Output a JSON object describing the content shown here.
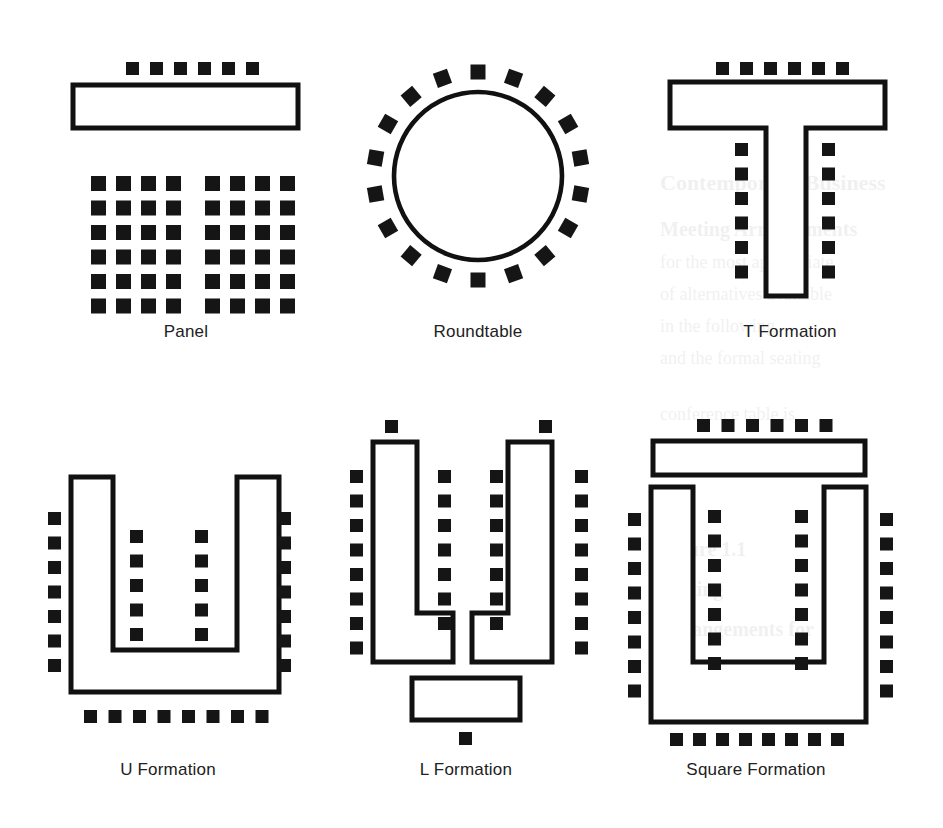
{
  "figure": {
    "background_color": "#ffffff",
    "ink_color": "#151515",
    "stroke_color": "#111111",
    "canvas": {
      "width": 943,
      "height": 828
    }
  },
  "captions": {
    "panel": "Panel",
    "roundtable": "Roundtable",
    "t_formation": "T Formation",
    "u_formation": "U Formation",
    "l_formation": "L Formation",
    "square_formation": "Square Formation"
  },
  "diagrams": [
    {
      "id": "panel",
      "label": "Panel",
      "caption_x": 186,
      "caption_y": 337,
      "chair_counts": {
        "head_table": 6,
        "audience_left_block": 24,
        "audience_right_block": 24
      },
      "tables": [
        {
          "name": "panel-head-table",
          "x": 73,
          "y": 85,
          "w": 225,
          "h": 43
        }
      ],
      "chair_rows": [
        {
          "name": "panel-head-chairs",
          "x0": 126,
          "y": 62,
          "count": 6,
          "step": 24,
          "size": 13
        }
      ],
      "grids": [
        {
          "name": "panel-audience-left",
          "x0": 91,
          "y0": 176,
          "cols": 4,
          "rows": 6,
          "dx": 25,
          "dy": 24.5,
          "size": 15
        },
        {
          "name": "panel-audience-right",
          "x0": 205,
          "y0": 176,
          "cols": 4,
          "rows": 6,
          "dx": 25,
          "dy": 24.5,
          "size": 15
        }
      ]
    },
    {
      "id": "roundtable",
      "label": "Roundtable",
      "caption_x": 478,
      "caption_y": 337,
      "chair_counts": {
        "around_table": 18
      },
      "circle": {
        "cx": 478,
        "cy": 176,
        "r": 84
      },
      "chair_ring": {
        "cx": 478,
        "cy": 176,
        "radius": 104,
        "count": 18,
        "size": 15,
        "start_angle_deg": -90
      }
    },
    {
      "id": "t-formation",
      "label": "T Formation",
      "caption_x": 790,
      "caption_y": 337,
      "chair_counts": {
        "top": 6,
        "stem_left": 6,
        "stem_right": 6
      },
      "polygon": "T-shape: crossbar 670,82 to 885,128 ; stem 766,128 to 806,296",
      "chair_rows": [
        {
          "name": "t-top-chairs",
          "x0": 716,
          "y": 62,
          "count": 6,
          "step": 24,
          "size": 13
        }
      ],
      "chair_columns": [
        {
          "name": "t-stem-left-chairs",
          "x": 735,
          "y0": 143,
          "count": 6,
          "step": 24.5,
          "size": 13
        },
        {
          "name": "t-stem-right-chairs",
          "x": 822,
          "y0": 143,
          "count": 6,
          "step": 24.5,
          "size": 13
        }
      ]
    },
    {
      "id": "u-formation",
      "label": "U Formation",
      "caption_x": 168,
      "caption_y": 775,
      "chair_counts": {
        "outer_left": 7,
        "outer_right": 7,
        "inner_left": 5,
        "inner_right": 5,
        "bottom": 8
      },
      "polygon": "U-shape: outer 71,477 to 265,477 / 265,650 / 178,650 / 178,477 (mirrored right)",
      "chair_columns": [
        {
          "name": "u-outer-left-chairs",
          "x": 48,
          "y0": 512,
          "count": 7,
          "step": 24.5,
          "size": 13
        },
        {
          "name": "u-outer-right-chairs",
          "x": 278,
          "y0": 512,
          "count": 7,
          "step": 24.5,
          "size": 13
        },
        {
          "name": "u-inner-left-chairs",
          "x": 130,
          "y0": 530,
          "count": 5,
          "step": 24.5,
          "size": 13
        },
        {
          "name": "u-inner-right-chairs",
          "x": 195,
          "y0": 530,
          "count": 5,
          "step": 24.5,
          "size": 13
        }
      ],
      "chair_rows": [
        {
          "name": "u-bottom-chairs",
          "x0": 84,
          "y": 710,
          "count": 8,
          "step": 24.5,
          "size": 13
        }
      ]
    },
    {
      "id": "l-formation",
      "label": "L Formation",
      "caption_x": 466,
      "caption_y": 775,
      "chair_counts": {
        "left_top": 1,
        "left_outer": 8,
        "left_inner": 7,
        "right_top": 1,
        "right_outer": 8,
        "right_inner": 7,
        "bottom_table": 1
      },
      "tables": [
        {
          "name": "l-bottom-table",
          "x": 412,
          "y": 678,
          "w": 108,
          "h": 42
        }
      ],
      "chair_rows": [],
      "single_chairs": [
        {
          "name": "l-left-top-chair",
          "x": 385,
          "y": 420,
          "size": 13
        },
        {
          "name": "l-right-top-chair",
          "x": 539,
          "y": 420,
          "size": 13
        },
        {
          "name": "l-bottom-chair",
          "x": 459,
          "y": 732,
          "size": 13
        }
      ],
      "chair_columns": [
        {
          "name": "l-left-outer-chairs",
          "x": 350,
          "y0": 470,
          "count": 8,
          "step": 24.5,
          "size": 13
        },
        {
          "name": "l-left-inner-chairs",
          "x": 438,
          "y0": 470,
          "count": 7,
          "step": 24.5,
          "size": 13
        },
        {
          "name": "l-right-outer-chairs",
          "x": 575,
          "y0": 470,
          "count": 8,
          "step": 24.5,
          "size": 13
        },
        {
          "name": "l-right-inner-chairs",
          "x": 490,
          "y0": 470,
          "count": 7,
          "step": 24.5,
          "size": 13
        }
      ]
    },
    {
      "id": "square-formation",
      "label": "Square Formation",
      "caption_x": 756,
      "caption_y": 775,
      "chair_counts": {
        "top": 6,
        "outer_left": 8,
        "outer_right": 8,
        "inner_left": 7,
        "inner_right": 7,
        "bottom": 8
      },
      "tables": [
        {
          "name": "square-head-table",
          "x": 653,
          "y": 441,
          "w": 212,
          "h": 34
        }
      ],
      "chair_rows": [
        {
          "name": "square-top-chairs",
          "x0": 697,
          "y": 419,
          "count": 6,
          "step": 24.5,
          "size": 13
        },
        {
          "name": "square-bottom-chairs",
          "x0": 670,
          "y": 733,
          "count": 8,
          "step": 23,
          "size": 13
        }
      ],
      "chair_columns": [
        {
          "name": "square-outer-left-chairs",
          "x": 628,
          "y0": 513,
          "count": 8,
          "step": 24.5,
          "size": 13
        },
        {
          "name": "square-outer-right-chairs",
          "x": 880,
          "y0": 513,
          "count": 8,
          "step": 24.5,
          "size": 13
        },
        {
          "name": "square-inner-left-chairs",
          "x": 708,
          "y0": 510,
          "count": 7,
          "step": 24.5,
          "size": 13
        },
        {
          "name": "square-inner-right-chairs",
          "x": 795,
          "y0": 510,
          "count": 7,
          "step": 24.5,
          "size": 13
        }
      ]
    }
  ],
  "background_bleed": {
    "visible": true,
    "note": "faint show-through of text from the reverse side of the printed page",
    "lines": [
      {
        "text": "Contemporary Business",
        "x": 660,
        "y": 190,
        "size": 22,
        "bold": true
      },
      {
        "text": "Meeting Arrangements",
        "x": 660,
        "y": 236,
        "size": 20,
        "bold": true
      },
      {
        "text": "for the most appropriate",
        "x": 660,
        "y": 268,
        "size": 18,
        "bold": false
      },
      {
        "text": "of alternatives available",
        "x": 660,
        "y": 300,
        "size": 18,
        "bold": false
      },
      {
        "text": "in the following",
        "x": 660,
        "y": 332,
        "size": 18,
        "bold": false
      },
      {
        "text": "and the formal seating",
        "x": 660,
        "y": 364,
        "size": 18,
        "bold": false
      },
      {
        "text": "conference table is",
        "x": 660,
        "y": 420,
        "size": 18,
        "bold": false
      },
      {
        "text": "arranged in a circle",
        "x": 660,
        "y": 460,
        "size": 18,
        "bold": false
      },
      {
        "text": "Figure 1.1",
        "x": 660,
        "y": 556,
        "size": 20,
        "bold": true
      },
      {
        "text": "Seating",
        "x": 660,
        "y": 596,
        "size": 20,
        "bold": true
      },
      {
        "text": "Arrangements for",
        "x": 660,
        "y": 636,
        "size": 20,
        "bold": true
      },
      {
        "text": "Meetings and",
        "x": 660,
        "y": 676,
        "size": 20,
        "bold": true
      },
      {
        "text": "Conferences",
        "x": 660,
        "y": 716,
        "size": 20,
        "bold": true
      }
    ]
  }
}
